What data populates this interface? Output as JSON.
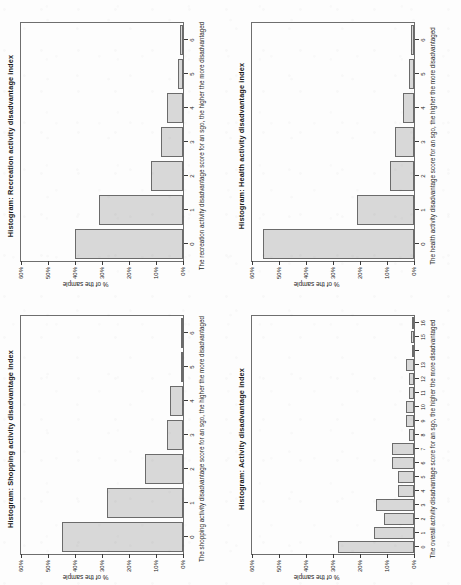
{
  "page": {
    "orientation": "rotated-90-ccw",
    "background_color": "#fdfdfd",
    "bar_fill_color": "#d8d8d8",
    "bar_border_color": "#6b6b6b",
    "axis_color": "#3a3a3a"
  },
  "chart_data": [
    {
      "id": "recreation",
      "type": "bar",
      "title": "Histogram: Recreation activity disadvantage index",
      "xlabel": "The recreation activity disadvantage score for an sgo, the higher the more disadvantaged",
      "ylabel": "% of the sample",
      "categories": [
        "0",
        "1",
        "2",
        "3",
        "4",
        "5",
        "6"
      ],
      "values": [
        40,
        31,
        12,
        8,
        6,
        2,
        1
      ],
      "ylim": [
        0,
        60
      ],
      "yticks": [
        0,
        10,
        20,
        30,
        40,
        50,
        60
      ],
      "yticklabels": [
        "0%",
        "10%",
        "20%",
        "30%",
        "40%",
        "50%",
        "60%"
      ],
      "xticklabels": [
        "0",
        "1",
        "2",
        "3",
        "4",
        "5",
        "6"
      ],
      "grid": false,
      "legend": "none"
    },
    {
      "id": "health",
      "type": "bar",
      "title": "Histogram: Health activity disadvantage index",
      "xlabel": "The health activity disadvantage score for an sgo, the higher the more disadvantaged",
      "ylabel": "% of the sample",
      "categories": [
        "0",
        "1",
        "2",
        "3",
        "4",
        "5",
        "6"
      ],
      "values": [
        56,
        21,
        9,
        7,
        4,
        2,
        1
      ],
      "ylim": [
        0,
        60
      ],
      "yticks": [
        0,
        10,
        20,
        30,
        40,
        50,
        60
      ],
      "yticklabels": [
        "0%",
        "10%",
        "20%",
        "30%",
        "40%",
        "50%",
        "60%"
      ],
      "xticklabels": [
        "0",
        "1",
        "2",
        "3",
        "4",
        "5",
        "6"
      ],
      "grid": false,
      "legend": "none"
    },
    {
      "id": "shopping",
      "type": "bar",
      "title": "Histogram: Shopping activity disadvantage index",
      "xlabel": "The shopping activity disadvantage score for an sgo, the higher the more disadvantaged",
      "ylabel": "% of the sample",
      "categories": [
        "0",
        "1",
        "2",
        "3",
        "4",
        "5",
        "6"
      ],
      "values": [
        45,
        28,
        14,
        6,
        5,
        0.5,
        0.5
      ],
      "ylim": [
        0,
        60
      ],
      "yticks": [
        0,
        10,
        20,
        30,
        40,
        50,
        60
      ],
      "yticklabels": [
        "0%",
        "10%",
        "20%",
        "30%",
        "40%",
        "50%",
        "60%"
      ],
      "xticklabels": [
        "0",
        "1",
        "2",
        "3",
        "4",
        "5",
        "6"
      ],
      "grid": false,
      "legend": "none"
    },
    {
      "id": "activity-overall",
      "type": "bar",
      "title": "Histogram: Activity disadvantage index",
      "xlabel": "The overall activity disadvantage score for an sgo, the higher the more disadvantaged",
      "ylabel": "% of the sample",
      "categories": [
        "0",
        "1",
        "2",
        "3",
        "4",
        "5",
        "6",
        "7",
        "8",
        "9",
        "10",
        "11",
        "12",
        "13",
        "14",
        "15",
        "16"
      ],
      "values": [
        28,
        15,
        11,
        14,
        6,
        6,
        8,
        8,
        2,
        3,
        3,
        2,
        2,
        3,
        0,
        1,
        0.5
      ],
      "ylim": [
        0,
        60
      ],
      "yticks": [
        0,
        10,
        20,
        30,
        40,
        50,
        60
      ],
      "yticklabels": [
        "0%",
        "10%",
        "20%",
        "30%",
        "40%",
        "50%",
        "60%"
      ],
      "xticklabels": [
        "0",
        "1",
        "2",
        "3",
        "4",
        "5",
        "6",
        "7",
        "8",
        "9",
        "10",
        "11",
        "12",
        "13",
        "",
        "15",
        "16"
      ],
      "grid": false,
      "legend": "none"
    }
  ]
}
